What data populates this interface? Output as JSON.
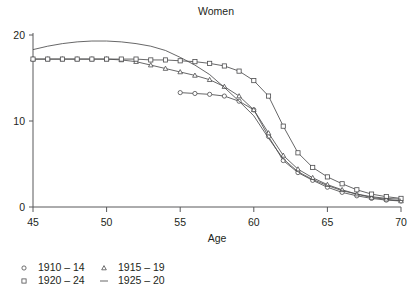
{
  "chart_data": {
    "type": "line",
    "title": "Women",
    "xlabel": "Age",
    "ylabel": "",
    "xlim": [
      45,
      70
    ],
    "ylim": [
      0,
      20
    ],
    "xticks": [
      45,
      50,
      55,
      60,
      65,
      70
    ],
    "yticks": [
      0,
      10,
      20
    ],
    "grid": false,
    "legend_position": "bottom-left",
    "series": [
      {
        "name": "1910 – 14",
        "marker": "circle",
        "x": [
          55,
          56,
          57,
          58,
          59,
          60,
          61,
          62,
          63,
          64,
          65,
          66,
          67,
          68,
          69,
          70
        ],
        "values": [
          13.3,
          13.2,
          13.1,
          12.9,
          12.3,
          11.3,
          8.2,
          5.4,
          4.0,
          3.1,
          2.3,
          1.7,
          1.3,
          1.0,
          0.8,
          0.7
        ]
      },
      {
        "name": "1915 – 19",
        "marker": "triangle",
        "x": [
          45,
          46,
          47,
          48,
          49,
          50,
          51,
          52,
          53,
          54,
          55,
          56,
          57,
          58,
          59,
          60,
          61,
          62,
          63,
          64,
          65,
          66,
          67,
          68,
          69,
          70
        ],
        "values": [
          17.2,
          17.2,
          17.2,
          17.2,
          17.2,
          17.2,
          17.1,
          16.9,
          16.5,
          16.1,
          15.7,
          15.3,
          14.8,
          14.0,
          12.9,
          11.3,
          8.6,
          6.0,
          4.4,
          3.4,
          2.6,
          2.0,
          1.5,
          1.1,
          0.9,
          0.7
        ]
      },
      {
        "name": "1920 – 24",
        "marker": "square",
        "x": [
          45,
          46,
          47,
          48,
          49,
          50,
          51,
          52,
          53,
          54,
          55,
          56,
          57,
          58,
          59,
          60,
          61,
          62,
          63,
          64,
          65,
          66,
          67,
          68,
          69,
          70
        ],
        "values": [
          17.2,
          17.2,
          17.2,
          17.2,
          17.2,
          17.2,
          17.2,
          17.2,
          17.1,
          17.1,
          17.0,
          16.9,
          16.7,
          16.4,
          15.8,
          14.7,
          12.9,
          9.4,
          6.3,
          4.6,
          3.5,
          2.7,
          2.0,
          1.5,
          1.2,
          1.0
        ]
      },
      {
        "name": "1925 – 20",
        "marker": "line",
        "x": [
          45,
          46,
          47,
          48,
          49,
          50,
          51,
          52,
          53,
          54,
          55,
          56,
          57,
          58,
          59,
          60,
          61,
          62,
          63,
          64,
          65,
          66,
          67,
          68,
          69,
          70
        ],
        "values": [
          18.3,
          18.7,
          19.0,
          19.2,
          19.3,
          19.3,
          19.2,
          19.0,
          18.7,
          18.2,
          17.4,
          16.5,
          15.4,
          13.9,
          12.3,
          10.6,
          8.0,
          5.6,
          4.1,
          3.2,
          2.5,
          1.9,
          1.5,
          1.2,
          1.0,
          0.9
        ]
      }
    ]
  },
  "legend": {
    "entries": [
      {
        "label": "1910 – 14",
        "marker": "circle"
      },
      {
        "label": "1920 – 24",
        "marker": "square"
      },
      {
        "label": "1915 – 19",
        "marker": "triangle"
      },
      {
        "label": "1925 – 20",
        "marker": "line"
      }
    ]
  },
  "axis": {
    "x_tick_labels": [
      "45",
      "50",
      "55",
      "60",
      "65",
      "70"
    ],
    "y_tick_labels": [
      "0",
      "10",
      "20"
    ]
  }
}
